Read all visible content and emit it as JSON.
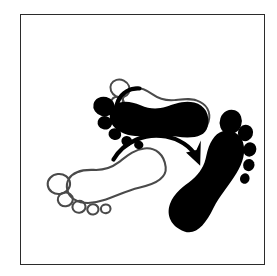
{
  "figure": {
    "background_color": "#ffffff",
    "frame": {
      "name": "border-frame",
      "stroke_color": "#2b2b2b",
      "stroke_width": 1.4,
      "x": 20,
      "y": 14,
      "width": 245,
      "height": 251
    },
    "ink_color": "#000000",
    "outline_color": "#4a4a4a",
    "caption": "Two pairs of footprints: an outlined start position and a filled black end position, each joined by a curved motion arrow."
  },
  "elements": {
    "upper_group": {
      "name": "upper-footprint-group",
      "label": "Pivot turn on the spot",
      "outline_foot": {
        "name": "outline-foot-upper",
        "side": "left",
        "fill": "none",
        "stroke": "#4a4a4a",
        "rotation_deg": 118,
        "center_x": 160,
        "center_y": 103,
        "scale": 0.72
      },
      "solid_foot": {
        "name": "solid-foot-upper",
        "side": "left",
        "fill": "#000000",
        "rotation_deg": 75,
        "center_x": 157,
        "center_y": 112,
        "scale": 0.78
      },
      "arrow": {
        "name": "rotation-arrow-upper",
        "style": "curved",
        "direction": "counter-clockwise",
        "from_x": 139,
        "from_y": 88,
        "to_x": 119,
        "to_y": 119,
        "stroke_width": 4.2
      }
    },
    "lower_group": {
      "name": "lower-footprint-group",
      "label": "Step across to new position",
      "outline_foot": {
        "name": "outline-foot-lower",
        "side": "left",
        "fill": "none",
        "stroke": "#4a4a4a",
        "rotation_deg": 0,
        "center_x": 110,
        "center_y": 173,
        "scale": 0.8
      },
      "solid_foot": {
        "name": "solid-foot-lower",
        "side": "right",
        "fill": "#000000",
        "rotation_deg": 22,
        "center_x": 212,
        "center_y": 175,
        "scale": 0.86
      },
      "arrow": {
        "name": "step-arrow-lower",
        "style": "curved",
        "direction": "clockwise",
        "from_x": 113,
        "from_y": 159,
        "to_x": 198,
        "to_y": 163,
        "stroke_width": 4.6
      }
    }
  }
}
